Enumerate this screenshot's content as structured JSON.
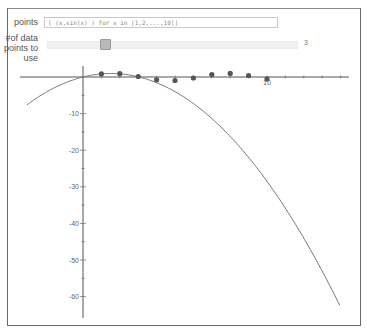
{
  "controls": {
    "points_label": "points",
    "points_value": "[ (x,sin(x) ) for x in [1,2,...,10]]",
    "num_points_label": "#of data points to use",
    "num_points_label_lines": [
      "#of data",
      "points to",
      "use"
    ],
    "num_points_value": "3"
  },
  "colors": {
    "axis": "#555555",
    "curve": "#777777",
    "points": "#555555",
    "frame": "#6a6a6a"
  },
  "chart_data": {
    "type": "scatter",
    "title": "",
    "xlabel": "",
    "ylabel": "",
    "x_tick_labels": [
      "10"
    ],
    "y_tick_labels": [
      "-10",
      "-20",
      "-30",
      "-40",
      "-50",
      "-60"
    ],
    "xlim": [
      -3.5,
      14.5
    ],
    "ylim": [
      -65,
      3
    ],
    "grid": false,
    "legend": null,
    "series": [
      {
        "name": "data points",
        "kind": "scatter",
        "x": [
          1,
          2,
          3,
          4,
          5,
          6,
          7,
          8,
          9,
          10
        ],
        "y": [
          0.84,
          0.91,
          0.14,
          -0.76,
          -0.96,
          -0.28,
          0.66,
          0.99,
          0.41,
          -0.54
        ]
      },
      {
        "name": "quadratic fit",
        "kind": "line",
        "x": [
          -3.0,
          -2,
          -1,
          0,
          1,
          1.5,
          2,
          3,
          4,
          6,
          8,
          10,
          12,
          14
        ],
        "y": [
          -8.2,
          -4.6,
          -1.9,
          0,
          1.1,
          1.3,
          1.1,
          -0.1,
          -2.2,
          -9.0,
          -19.3,
          -33.0,
          -50.0,
          -63.0
        ]
      }
    ]
  }
}
